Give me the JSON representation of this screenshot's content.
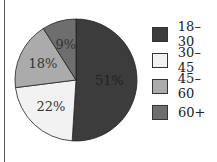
{
  "chart_data": {
    "type": "pie",
    "title": "",
    "categories": [
      "18–30",
      "30–45",
      "45–60",
      "60+"
    ],
    "values": [
      51,
      22,
      18,
      9
    ],
    "labels": [
      "51%",
      "22%",
      "18%",
      "9%"
    ],
    "colors": [
      "#3c3c3c",
      "#f2f2f2",
      "#ababab",
      "#6e6e6e"
    ],
    "legend_position": "right",
    "start_angle": "12 o'clock",
    "direction": "clockwise"
  },
  "legend": [
    {
      "label": "18–30",
      "color": "#3c3c3c"
    },
    {
      "label": "30–45",
      "color": "#f2f2f2"
    },
    {
      "label": "45–60",
      "color": "#ababab"
    },
    {
      "label": "60+",
      "color": "#6e6e6e"
    }
  ]
}
